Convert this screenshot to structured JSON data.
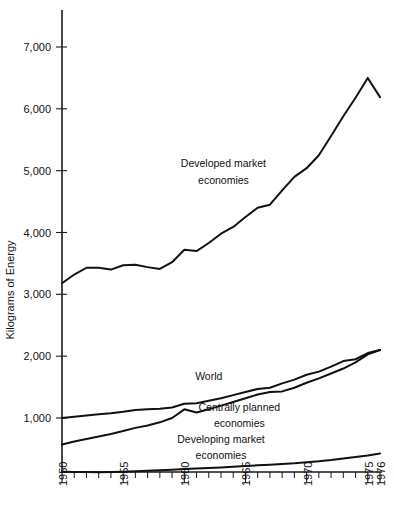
{
  "chart_data": {
    "type": "line",
    "title": "",
    "subtitle": "",
    "xlabel": "",
    "ylabel": "Kilograms of Energy",
    "xlim": [
      1950,
      1976
    ],
    "ylim": [
      0,
      7600
    ],
    "grid": false,
    "legend_position": "inline-annotations",
    "y_ticks": [
      1000,
      2000,
      3000,
      4000,
      5000,
      6000,
      7000
    ],
    "y_tick_labels": [
      "1,000",
      "2,000",
      "3,000",
      "4,000",
      "5,000",
      "6,000",
      "7,000"
    ],
    "x_ticks": [
      1950,
      1951,
      1952,
      1953,
      1954,
      1955,
      1956,
      1957,
      1958,
      1959,
      1960,
      1961,
      1962,
      1963,
      1964,
      1965,
      1966,
      1967,
      1968,
      1969,
      1970,
      1971,
      1972,
      1973,
      1974,
      1975,
      1976
    ],
    "x_tick_labels_shown": [
      "1950",
      "1955",
      "1960",
      "1965",
      "1970",
      "1975",
      "1976"
    ],
    "x_labeled_years": [
      1950,
      1955,
      1960,
      1965,
      1970,
      1975,
      1976
    ],
    "x": [
      1950,
      1951,
      1952,
      1953,
      1954,
      1955,
      1956,
      1957,
      1958,
      1959,
      1960,
      1961,
      1962,
      1963,
      1964,
      1965,
      1966,
      1967,
      1968,
      1969,
      1970,
      1971,
      1972,
      1973,
      1974,
      1975,
      1976
    ],
    "series": [
      {
        "name": "Developed market economies",
        "label": "Developed market\neconomies",
        "label_line1": "Developed market",
        "label_line2": "economies",
        "color": "#111111",
        "values": [
          3180,
          3320,
          3430,
          3430,
          3400,
          3470,
          3480,
          3440,
          3410,
          3520,
          3720,
          3700,
          3830,
          3980,
          4090,
          4250,
          4400,
          4450,
          4680,
          4900,
          5040,
          5250,
          5560,
          5880,
          6180,
          6500,
          6190
        ]
      },
      {
        "name": "World",
        "label": "World",
        "label_line1": "World",
        "label_line2": "",
        "color": "#111111",
        "values": [
          1000,
          1020,
          1040,
          1060,
          1075,
          1100,
          1130,
          1140,
          1150,
          1170,
          1230,
          1240,
          1280,
          1320,
          1370,
          1420,
          1470,
          1490,
          1560,
          1620,
          1700,
          1750,
          1830,
          1920,
          1950,
          2050,
          2100
        ]
      },
      {
        "name": "Centrally planned economies",
        "label": "Centrally planned\neconomies",
        "label_line1": "Centrally planned",
        "label_line2": "economies",
        "color": "#111111",
        "values": [
          570,
          620,
          660,
          700,
          740,
          790,
          840,
          880,
          930,
          1000,
          1140,
          1090,
          1140,
          1200,
          1260,
          1320,
          1380,
          1420,
          1430,
          1490,
          1570,
          1640,
          1720,
          1800,
          1900,
          2030,
          2100
        ]
      },
      {
        "name": "Developing market economies",
        "label": "Developing market\neconomies",
        "label_line1": "Developing market",
        "label_line2": "economies",
        "color": "#111111",
        "values": [
          130,
          128,
          126,
          124,
          126,
          132,
          140,
          148,
          156,
          164,
          175,
          183,
          192,
          201,
          211,
          222,
          234,
          244,
          256,
          268,
          285,
          300,
          320,
          345,
          370,
          395,
          425
        ]
      }
    ],
    "annotations": [
      {
        "text": "Developed market",
        "x": 1963.2,
        "y": 5060
      },
      {
        "text": "economies",
        "x": 1963.2,
        "y": 4780
      },
      {
        "text": "World",
        "x": 1962.0,
        "y": 1620
      },
      {
        "text": "Centrally planned",
        "x": 1964.5,
        "y": 1120
      },
      {
        "text": "economies",
        "x": 1964.5,
        "y": 860
      },
      {
        "text": "Developing market",
        "x": 1963.0,
        "y": 600
      },
      {
        "text": "economies",
        "x": 1963.0,
        "y": 340
      }
    ]
  },
  "axis": {
    "y_title": "Kilograms of Energy"
  }
}
